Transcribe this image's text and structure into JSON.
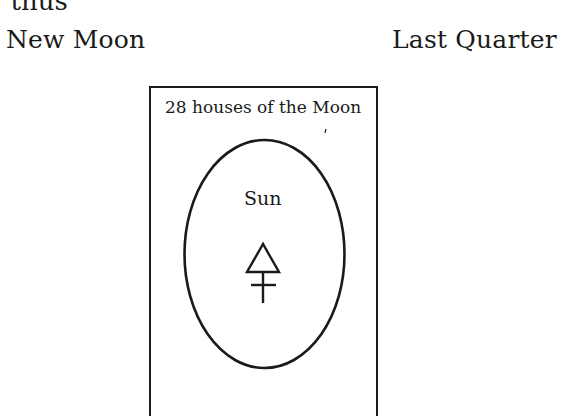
{
  "page": {
    "top_fragment": ", thus"
  },
  "labels": {
    "left_phase": "New Moon",
    "right_phase": "Last Quarter"
  },
  "diagram": {
    "box_caption": "28 houses of the Moon",
    "center_label": "Sun",
    "symbol": "sulphur-symbol",
    "stroke_color": "#1a1a1a",
    "background_color": "#ffffff"
  }
}
